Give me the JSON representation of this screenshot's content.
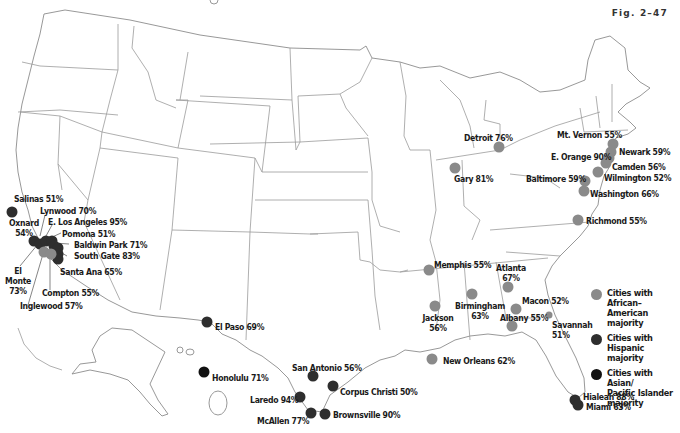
{
  "figure": {
    "label": "Fig. 2–47"
  },
  "colors": {
    "african_american": "#8a8a8a",
    "hispanic": "#2e2e2e",
    "asian_pacific": "#111111",
    "state_border": "#9a9a9a",
    "background": "#ffffff"
  },
  "legend": {
    "items": [
      {
        "key": "african_american",
        "label_line1": "Cities with African–",
        "label_line2": "American majority",
        "label_line3": ""
      },
      {
        "key": "hispanic",
        "label_line1": "Cities with Hispanic",
        "label_line2": "majority",
        "label_line3": ""
      },
      {
        "key": "asian_pacific",
        "label_line1": "Cities with Asian/",
        "label_line2": "Pacific Islander",
        "label_line3": "majority"
      }
    ]
  },
  "cities": {
    "african_american": [
      {
        "name": "Detroit",
        "pct": "76%",
        "label": "Detroit 76%"
      },
      {
        "name": "Gary",
        "pct": "81%",
        "label": "Gary 81%"
      },
      {
        "name": "Mt. Vernon",
        "pct": "55%",
        "label": "Mt. Vernon 55%"
      },
      {
        "name": "Newark",
        "pct": "59%",
        "label": "Newark 59%"
      },
      {
        "name": "E. Orange",
        "pct": "90%",
        "label": "E. Orange 90%"
      },
      {
        "name": "Camden",
        "pct": "56%",
        "label": "Camden 56%"
      },
      {
        "name": "Wilmington",
        "pct": "52%",
        "label": "Wilmington 52%"
      },
      {
        "name": "Baltimore",
        "pct": "59%",
        "label": "Baltimore 59%"
      },
      {
        "name": "Washington",
        "pct": "66%",
        "label": "Washington 66%"
      },
      {
        "name": "Richmond",
        "pct": "55%",
        "label": "Richmond 55%"
      },
      {
        "name": "Memphis",
        "pct": "55%",
        "label": "Memphis 55%"
      },
      {
        "name": "Atlanta",
        "pct": "67%",
        "label": "Atlanta"
      },
      {
        "name": "Birmingham",
        "pct": "63%",
        "label": "Birmingham"
      },
      {
        "name": "Macon",
        "pct": "52%",
        "label": "Macon 52%"
      },
      {
        "name": "Jackson",
        "pct": "56%",
        "label": "Jackson"
      },
      {
        "name": "Albany",
        "pct": "55%",
        "label": "Albany 55%"
      },
      {
        "name": "Savannah",
        "pct": "51%",
        "label": "Savannah"
      },
      {
        "name": "New Orleans",
        "pct": "62%",
        "label": "New Orleans 62%"
      },
      {
        "name": "Compton",
        "pct": "55%",
        "label": "Compton 55%"
      },
      {
        "name": "Inglewood",
        "pct": "57%",
        "label": "Inglewood 57%"
      }
    ],
    "hispanic": [
      {
        "name": "Salinas",
        "pct": "51%",
        "label": "Salinas 51%"
      },
      {
        "name": "Oxnard",
        "pct": "54%",
        "label": "Oxnard"
      },
      {
        "name": "Lynwood",
        "pct": "70%",
        "label": "Lynwood 70%"
      },
      {
        "name": "E. Los Angeles",
        "pct": "95%",
        "label": "E. Los Angeles 95%"
      },
      {
        "name": "Pomona",
        "pct": "51%",
        "label": "Pomona 51%"
      },
      {
        "name": "Baldwin Park",
        "pct": "71%",
        "label": "Baldwin Park 71%"
      },
      {
        "name": "South Gate",
        "pct": "83%",
        "label": "South Gate 83%"
      },
      {
        "name": "Santa Ana",
        "pct": "65%",
        "label": "Santa Ana 65%"
      },
      {
        "name": "El Monte",
        "pct": "73%",
        "label": "El"
      },
      {
        "name": "El Paso",
        "pct": "69%",
        "label": "El Paso 69%"
      },
      {
        "name": "San Antonio",
        "pct": "56%",
        "label": "San Antonio 56%"
      },
      {
        "name": "Corpus Christi",
        "pct": "50%",
        "label": "Corpus Christi 50%"
      },
      {
        "name": "Laredo",
        "pct": "94%",
        "label": "Laredo 94%"
      },
      {
        "name": "McAllen",
        "pct": "77%",
        "label": "McAllen 77%"
      },
      {
        "name": "Brownsville",
        "pct": "90%",
        "label": "Brownsville 90%"
      },
      {
        "name": "Hialeah",
        "pct": "88%",
        "label": "Hialeah 88%"
      },
      {
        "name": "Miami",
        "pct": "63%",
        "label": "Miami 63%"
      }
    ],
    "asian_pacific": [
      {
        "name": "Honolulu",
        "pct": "71%",
        "label": "Honolulu 71%"
      }
    ]
  },
  "multiline_labels": {
    "oxnard_pct": "54%",
    "el_monte_line2": "Monte",
    "el_monte_pct": "73%",
    "atlanta_pct": "67%",
    "birmingham_pct": "63%",
    "jackson_pct": "56%",
    "savannah_pct": "51%"
  }
}
